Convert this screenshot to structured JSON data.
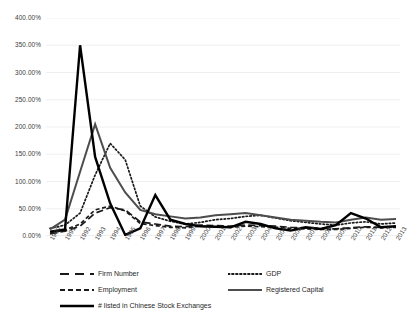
{
  "chart_data": {
    "type": "line",
    "title": "",
    "xlabel": "",
    "ylabel": "",
    "grid": "horizontal",
    "legend_position": "bottom",
    "ylim": [
      0,
      400
    ],
    "y_unit": "%",
    "y_ticks": [
      "0.00%",
      "50.00%",
      "100.00%",
      "150.00%",
      "200.00%",
      "250.00%",
      "300.00%",
      "350.00%",
      "400.00%"
    ],
    "y_tick_values": [
      0,
      50,
      100,
      150,
      200,
      250,
      300,
      350,
      400
    ],
    "categories": [
      "1990",
      "1991",
      "1992",
      "1993",
      "1994",
      "1995",
      "1996",
      "1997",
      "1998",
      "1999",
      "2000",
      "2001",
      "2002",
      "2003",
      "2004",
      "2005",
      "2006",
      "2007",
      "2008",
      "2009",
      "2010",
      "2011",
      "2012",
      "2013"
    ],
    "series": [
      {
        "name": "Firm Number",
        "style": "long-dash",
        "color": "#1a1a1a",
        "width": 1.7,
        "values": [
          4,
          9,
          18,
          42,
          52,
          48,
          26,
          22,
          18,
          17,
          20,
          19,
          18,
          20,
          19,
          18,
          16,
          15,
          14,
          13,
          15,
          17,
          16,
          17
        ]
      },
      {
        "name": "GDP",
        "style": "dotted",
        "color": "#1a1a1a",
        "width": 1.7,
        "values": [
          14,
          20,
          42,
          112,
          170,
          140,
          55,
          35,
          27,
          22,
          25,
          30,
          32,
          36,
          38,
          33,
          28,
          25,
          22,
          20,
          24,
          26,
          22,
          24
        ]
      },
      {
        "name": "Employment",
        "style": "short-dash",
        "color": "#1a1a1a",
        "width": 1.7,
        "values": [
          5,
          11,
          22,
          48,
          55,
          46,
          23,
          19,
          16,
          15,
          18,
          17,
          16,
          18,
          17,
          16,
          14,
          13,
          12,
          12,
          14,
          16,
          15,
          16
        ]
      },
      {
        "name": "Registered Capital",
        "style": "solid-medium",
        "color": "#4d4d4d",
        "width": 2.0,
        "values": [
          12,
          30,
          118,
          205,
          125,
          80,
          48,
          40,
          36,
          32,
          34,
          38,
          40,
          42,
          38,
          34,
          30,
          28,
          26,
          25,
          30,
          34,
          30,
          31
        ]
      },
      {
        "name": "# listed in Chinese Stock Exchanges",
        "style": "solid-thick",
        "color": "#000000",
        "width": 2.4,
        "values": [
          8,
          12,
          350,
          145,
          60,
          2,
          14,
          75,
          30,
          22,
          18,
          17,
          16,
          26,
          22,
          14,
          10,
          16,
          13,
          20,
          42,
          32,
          16,
          18
        ]
      }
    ]
  },
  "legend": {
    "entries": [
      {
        "label": "Firm Number",
        "style": "long-dash"
      },
      {
        "label": "GDP",
        "style": "dotted"
      },
      {
        "label": "Employment",
        "style": "short-dash"
      },
      {
        "label": "Registered Capital",
        "style": "solid-medium"
      },
      {
        "label": "# listed in Chinese Stock Exchanges",
        "style": "solid-thick"
      }
    ]
  },
  "colors": {
    "gridline": "#e8e8e8",
    "text": "#3a3a3a",
    "background": "#ffffff"
  }
}
